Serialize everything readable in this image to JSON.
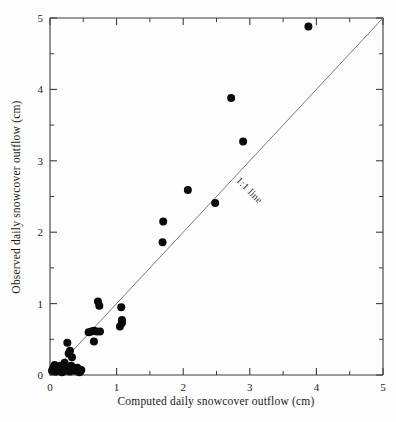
{
  "chart_data": {
    "type": "scatter",
    "title": "",
    "xlabel": "Computed daily snowcover outflow (cm)",
    "ylabel": "Observed daily snowcover outflow (cm)",
    "xlim": [
      0,
      5
    ],
    "ylim": [
      0,
      5
    ],
    "xticks": [
      0,
      1,
      2,
      3,
      4,
      5
    ],
    "yticks": [
      0,
      1,
      2,
      3,
      4,
      5
    ],
    "xtick_labels": [
      "0",
      "1",
      "2",
      "3",
      "4",
      "5"
    ],
    "ytick_labels": [
      "0",
      "1",
      "2",
      "3",
      "4",
      "5"
    ],
    "minor_tick_step": 0.5,
    "grid": false,
    "legend": "none",
    "marker": "filled-circle",
    "marker_color": "#0a0a0a",
    "marker_size_px": 8,
    "annotations": [
      {
        "text": "1:1 line",
        "x": 2.75,
        "y": 2.75,
        "rotation_deg": -45,
        "description": "label placed along the 1:1 identity line"
      }
    ],
    "reference_line": {
      "name": "1:1 line",
      "from": [
        0,
        0
      ],
      "to": [
        5,
        5
      ],
      "color": "#6b6b6b"
    },
    "series": [
      {
        "name": "Daily snowcover outflow",
        "points": [
          [
            0.03,
            0.06
          ],
          [
            0.05,
            0.1
          ],
          [
            0.07,
            0.14
          ],
          [
            0.09,
            0.05
          ],
          [
            0.11,
            0.12
          ],
          [
            0.13,
            0.07
          ],
          [
            0.16,
            0.13
          ],
          [
            0.18,
            0.04
          ],
          [
            0.21,
            0.09
          ],
          [
            0.24,
            0.06
          ],
          [
            0.27,
            0.11
          ],
          [
            0.3,
            0.05
          ],
          [
            0.32,
            0.13
          ],
          [
            0.35,
            0.08
          ],
          [
            0.38,
            0.06
          ],
          [
            0.41,
            0.1
          ],
          [
            0.44,
            0.05
          ],
          [
            0.47,
            0.07
          ],
          [
            0.28,
            0.3
          ],
          [
            0.3,
            0.34
          ],
          [
            0.26,
            0.45
          ],
          [
            0.33,
            0.25
          ],
          [
            0.22,
            0.17
          ],
          [
            0.44,
            0.04
          ],
          [
            0.58,
            0.6
          ],
          [
            0.62,
            0.61
          ],
          [
            0.66,
            0.62
          ],
          [
            0.7,
            0.61
          ],
          [
            0.75,
            0.61
          ],
          [
            0.66,
            0.47
          ],
          [
            0.72,
            1.03
          ],
          [
            0.74,
            0.97
          ],
          [
            1.07,
            0.95
          ],
          [
            1.08,
            0.73
          ],
          [
            1.05,
            0.68
          ],
          [
            1.08,
            0.77
          ],
          [
            1.7,
            2.15
          ],
          [
            1.69,
            1.86
          ],
          [
            2.07,
            2.59
          ],
          [
            2.48,
            2.41
          ],
          [
            2.72,
            3.88
          ],
          [
            2.9,
            3.27
          ],
          [
            3.88,
            4.88
          ]
        ]
      }
    ]
  },
  "figure": {
    "x_axis_title": "Computed daily snowcover outflow (cm)",
    "y_axis_title": "Observed daily snowcover outflow (cm)",
    "identity_label": "1:1 line"
  }
}
